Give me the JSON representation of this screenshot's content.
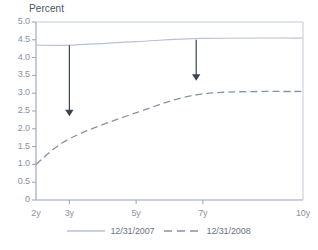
{
  "chart_data": {
    "type": "line",
    "title": "Percent",
    "xlabel": "",
    "ylabel": "Percent",
    "x": [
      "2y",
      "3y",
      "5y",
      "7y",
      "10y"
    ],
    "x_positions": [
      2,
      3,
      5,
      7,
      10
    ],
    "xlim": [
      2,
      10
    ],
    "ylim": [
      0,
      5.0
    ],
    "ytick_labels": [
      "5.0",
      "4.5",
      "4.0",
      "3.5",
      "3.0",
      "2.5",
      "2.0",
      "1.5",
      "1.0",
      "0.5",
      "0"
    ],
    "ytick_values": [
      5.0,
      4.5,
      4.0,
      3.5,
      3.0,
      2.5,
      2.0,
      1.5,
      1.0,
      0.5,
      0
    ],
    "grid": false,
    "legend_position": "bottom",
    "series": [
      {
        "name": "12/31/2007",
        "style": "solid",
        "color": "#b9c2d2",
        "values": [
          4.35,
          4.35,
          4.45,
          4.54,
          4.55
        ]
      },
      {
        "name": "12/31/2008",
        "style": "dashed",
        "color": "#8892a6",
        "values": [
          1.0,
          1.72,
          2.45,
          2.98,
          3.05
        ]
      }
    ],
    "annotations": [
      {
        "name": "arrow-at-3y",
        "type": "down-arrow",
        "x": 3,
        "y_start": 4.35,
        "y_end": 2.35,
        "color": "#3a4356"
      },
      {
        "name": "arrow-at-6.8y",
        "type": "down-arrow",
        "x": 6.8,
        "y_start": 4.5,
        "y_end": 3.35,
        "color": "#3a4356"
      }
    ]
  },
  "axis": {
    "y_title": "Percent"
  },
  "legend": {
    "items": [
      {
        "label": "12/31/2007",
        "style": "solid"
      },
      {
        "label": "12/31/2008",
        "style": "dashed"
      }
    ]
  },
  "colors": {
    "series_2007": "#b9c2d2",
    "series_2008": "#8892a6",
    "arrow": "#3a4356",
    "axis": "#9aa2b1",
    "tick_text": "#8a93a3",
    "title_text": "#4c5666"
  }
}
